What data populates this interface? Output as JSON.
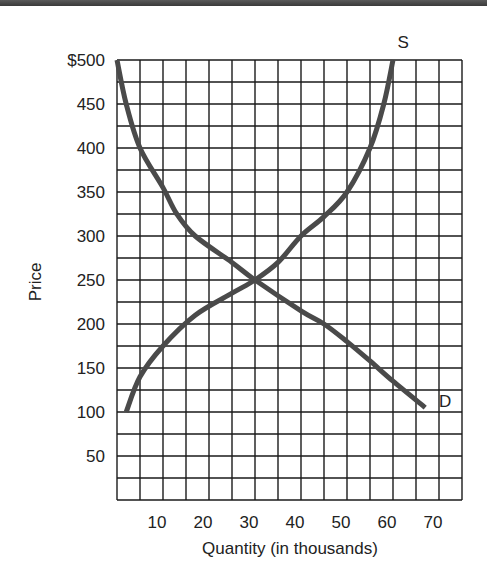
{
  "chart_data": {
    "type": "line",
    "title": "",
    "xlabel": "Quantity (in thousands)",
    "ylabel": "Price",
    "xlim": [
      0,
      75
    ],
    "ylim": [
      0,
      500
    ],
    "x_ticks": [
      10,
      20,
      30,
      40,
      50,
      60,
      70
    ],
    "y_ticks": [
      "$500",
      "450",
      "400",
      "350",
      "300",
      "250",
      "200",
      "150",
      "100",
      "50"
    ],
    "y_tick_values": [
      500,
      450,
      400,
      350,
      300,
      250,
      200,
      150,
      100,
      50
    ],
    "grid": true,
    "grid_x_step": 5,
    "grid_y_step": 25,
    "series": [
      {
        "name": "S",
        "label": "S",
        "points": [
          [
            2,
            100
          ],
          [
            5,
            140
          ],
          [
            10,
            175
          ],
          [
            17,
            210
          ],
          [
            25,
            235
          ],
          [
            30,
            250
          ],
          [
            35,
            270
          ],
          [
            40,
            300
          ],
          [
            45,
            322
          ],
          [
            50,
            350
          ],
          [
            55,
            400
          ],
          [
            58,
            450
          ],
          [
            60,
            500
          ]
        ]
      },
      {
        "name": "D",
        "label": "D",
        "points": [
          [
            0,
            500
          ],
          [
            2,
            450
          ],
          [
            5,
            400
          ],
          [
            10,
            355
          ],
          [
            13,
            325
          ],
          [
            17,
            300
          ],
          [
            25,
            270
          ],
          [
            30,
            250
          ],
          [
            40,
            215
          ],
          [
            45,
            200
          ],
          [
            50,
            180
          ],
          [
            55,
            158
          ],
          [
            60,
            135
          ],
          [
            67,
            105
          ]
        ]
      }
    ],
    "annotations": [
      {
        "text": "S",
        "x": 61,
        "y": 520
      },
      {
        "text": "D",
        "x": 70,
        "y": 112
      }
    ],
    "equilibrium": {
      "quantity": 30,
      "price": 250
    }
  }
}
